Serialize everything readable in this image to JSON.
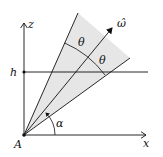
{
  "diagram": {
    "labels": {
      "z_axis": "z",
      "x_axis": "x",
      "height": "h",
      "origin": "A",
      "axis_vector": "ω̂",
      "half_angle_left": "θ",
      "half_angle_right": "θ",
      "elevation": "α"
    },
    "colors": {
      "stroke": "#111111",
      "cone_fill": "#e6e6e6",
      "background": "#ffffff"
    }
  }
}
